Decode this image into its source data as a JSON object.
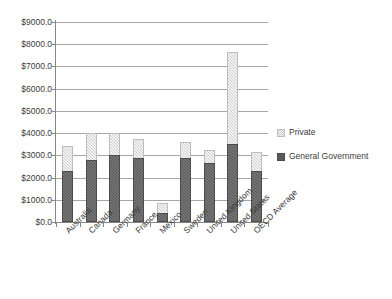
{
  "chart_data": {
    "type": "bar",
    "stacked": true,
    "title": "",
    "subtitle": "",
    "xlabel": "",
    "ylabel": "",
    "ylim": [
      0,
      9000
    ],
    "ytick_step": 1000,
    "ytick_labels": [
      "$0.0",
      "$1000.0",
      "$2000.0",
      "$3000.0",
      "$4000.0",
      "$5000.0",
      "$6000.0",
      "$7000.0",
      "$8000.0",
      "$9000.0"
    ],
    "ytick_values": [
      0,
      1000,
      2000,
      3000,
      4000,
      5000,
      6000,
      7000,
      8000,
      9000
    ],
    "grid": true,
    "grid_axis": "y",
    "legend_position": "right",
    "categories": [
      "Australia",
      "Canada",
      "Germany",
      "France",
      "Mexico",
      "Sweden",
      "United Kingdom",
      "United States",
      "OECD Average"
    ],
    "series": [
      {
        "name": "General Government",
        "color": "#595959",
        "values": [
          2300,
          2800,
          3000,
          2900,
          400,
          2900,
          2650,
          3500,
          2300
        ]
      },
      {
        "name": "Private",
        "color": "#cfcfcf",
        "values": [
          1100,
          1200,
          1000,
          850,
          450,
          700,
          600,
          4150,
          850
        ]
      }
    ],
    "totals": [
      3400,
      4000,
      4000,
      3750,
      850,
      3600,
      3250,
      7650,
      3150
    ]
  },
  "legend": {
    "items": [
      {
        "label": "Private",
        "key": "private"
      },
      {
        "label": "General Government",
        "key": "gov"
      }
    ]
  }
}
